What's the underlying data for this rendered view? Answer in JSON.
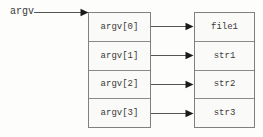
{
  "diagram": {
    "argv_label": "argv",
    "pointer_array": {
      "cells": [
        {
          "label": "argv[0]"
        },
        {
          "label": "argv[1]"
        },
        {
          "label": "argv[2]"
        },
        {
          "label": "argv[3]"
        }
      ]
    },
    "string_array": {
      "cells": [
        {
          "label": "file1"
        },
        {
          "label": "str1"
        },
        {
          "label": "str2"
        },
        {
          "label": "str3"
        }
      ]
    },
    "colors": {
      "background": "#fdfdfc",
      "box_border": "#808080",
      "box_fill": "#fafaf8",
      "text": "#3a3a3a",
      "arrow_line": "#555555",
      "arrow_head": "#1a1a1a"
    }
  }
}
